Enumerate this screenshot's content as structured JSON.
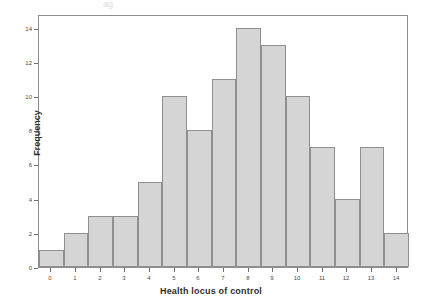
{
  "figure": {
    "top_artifact_text": "ag",
    "background_color": "#ffffff",
    "frame_color": "#8c8c8c"
  },
  "chart_data": {
    "type": "bar",
    "title": "",
    "subtitle": "",
    "xlabel": "Health locus of control",
    "ylabel": "Frequency",
    "categories": [
      "0",
      "1",
      "2",
      "3",
      "4",
      "5",
      "6",
      "7",
      "8",
      "9",
      "10",
      "11",
      "12",
      "13",
      "14"
    ],
    "values": [
      1,
      2,
      3,
      3,
      5,
      10,
      8,
      11,
      14,
      13,
      10,
      7,
      4,
      7,
      2
    ],
    "xlim": [
      -0.5,
      14.5
    ],
    "ylim": [
      0,
      14.8
    ],
    "ytick_labels": [
      "0",
      "2",
      "4",
      "6",
      "8",
      "10",
      "12",
      "14"
    ],
    "ytick_values": [
      0,
      2,
      4,
      6,
      8,
      10,
      12,
      14
    ],
    "xtick_labels": [
      "0",
      "1",
      "2",
      "3",
      "4",
      "5",
      "6",
      "7",
      "8",
      "9",
      "10",
      "11",
      "12",
      "13",
      "14"
    ],
    "grid": false,
    "legend": null,
    "legend_position": "none",
    "bar_fill_color": "#d5d5d5",
    "bar_edge_color": "#8f8f8f",
    "bar_width_fraction": 1.0,
    "annotations": []
  }
}
